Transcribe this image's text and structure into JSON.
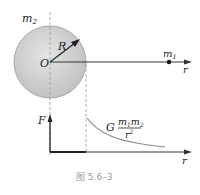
{
  "figure": {
    "caption": "图 5.6–3",
    "top": {
      "sphere_label": "m",
      "sphere_label_sub": "2",
      "radius_label": "R",
      "center_label": "O",
      "point_label": "m",
      "point_label_sub": "1",
      "axis_label": "r"
    },
    "bottom": {
      "y_axis_label": "F",
      "x_axis_label": "r",
      "formula_G": "G",
      "formula_num_m1": "m",
      "formula_num_sub1": "1",
      "formula_num_m2": "m",
      "formula_num_sub2": "2",
      "formula_den_r": "r",
      "formula_den_exp": "2"
    },
    "colors": {
      "sphere_fill": "#cfcfcf",
      "sphere_edge": "#a8a8a8",
      "line": "#333333",
      "curve": "#8a8a8a",
      "dash": "#9a9a9a"
    }
  }
}
